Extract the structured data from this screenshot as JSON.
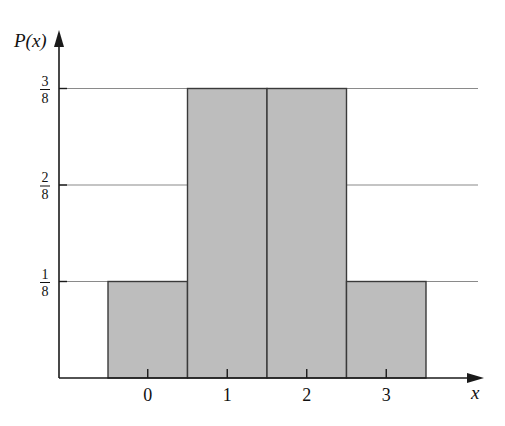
{
  "chart_data": {
    "type": "bar",
    "title": "",
    "xlabel": "x",
    "ylabel": "P(x)",
    "categories": [
      "0",
      "1",
      "2",
      "3"
    ],
    "values": [
      0.125,
      0.375,
      0.375,
      0.125
    ],
    "value_labels": [
      "1/8",
      "3/8",
      "3/8",
      "1/8"
    ],
    "yticks": [
      {
        "value": 0.125,
        "num": "1",
        "den": "8"
      },
      {
        "value": 0.25,
        "num": "2",
        "den": "8"
      },
      {
        "value": 0.375,
        "num": "3",
        "den": "8"
      }
    ],
    "ylim": [
      0,
      0.42
    ],
    "grid": "horizontal lines at y ticks",
    "legend": null,
    "bar_style": "histogram, adjacent bars with no gap",
    "colors": {
      "bar_fill": "#bdbdbd",
      "bar_stroke": "#3a3a3a",
      "grid": "#8a8a8a",
      "axis": "#1a1a1a",
      "text": "#111111"
    }
  }
}
